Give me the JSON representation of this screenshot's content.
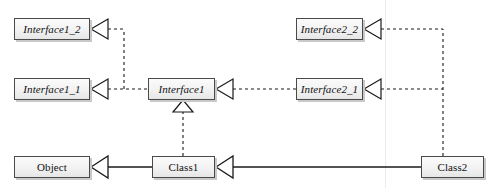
{
  "diagram": {
    "background_color": "#ffffff",
    "node_fill_color": "#f2f2f2",
    "node_border_color": "#4a4a4a",
    "node_shadow_color": "#c9c9c9",
    "line_color": "#1a1a1a",
    "guide_line_color": "#e8e8e8",
    "nodes": [
      {
        "id": "interface1_2",
        "label": "Interface1_2",
        "style": "interface",
        "x": 14,
        "y": 18,
        "w": 76,
        "h": 22
      },
      {
        "id": "interface1_1",
        "label": "Interface1_1",
        "style": "interface",
        "x": 14,
        "y": 78,
        "w": 76,
        "h": 22
      },
      {
        "id": "interface1",
        "label": "Interface1",
        "style": "interface",
        "x": 148,
        "y": 78,
        "w": 67,
        "h": 22
      },
      {
        "id": "interface2_2",
        "label": "Interface2_2",
        "style": "interface",
        "x": 296,
        "y": 18,
        "w": 67,
        "h": 22
      },
      {
        "id": "interface2_1",
        "label": "Interface2_1",
        "style": "interface",
        "x": 296,
        "y": 78,
        "w": 67,
        "h": 22
      },
      {
        "id": "object",
        "label": "Object",
        "style": "class",
        "x": 14,
        "y": 156,
        "w": 76,
        "h": 22
      },
      {
        "id": "class1",
        "label": "Class1",
        "style": "class",
        "x": 152,
        "y": 156,
        "w": 63,
        "h": 22
      },
      {
        "id": "class2",
        "label": "Class2",
        "style": "class",
        "x": 421,
        "y": 156,
        "w": 63,
        "h": 22
      }
    ],
    "edges": [
      {
        "id": "interface1-to-interface1_1",
        "from": "interface1",
        "to": "interface1_1",
        "kind": "realization",
        "line": "dashed",
        "arrow": "hollow-triangle"
      },
      {
        "id": "interface1-to-interface1_2",
        "from": "interface1",
        "to": "interface1_2",
        "kind": "realization",
        "line": "dashed",
        "arrow": "hollow-triangle"
      },
      {
        "id": "class1-to-interface1",
        "from": "class1",
        "to": "interface1",
        "kind": "realization",
        "line": "dashed",
        "arrow": "hollow-triangle"
      },
      {
        "id": "class2-to-interface2_1",
        "from": "class2",
        "to": "interface2_1",
        "kind": "realization",
        "line": "dashed",
        "arrow": "hollow-triangle"
      },
      {
        "id": "class2-to-interface2_2",
        "from": "class2",
        "to": "interface2_2",
        "kind": "realization",
        "line": "dashed",
        "arrow": "hollow-triangle"
      },
      {
        "id": "class1-to-object",
        "from": "class1",
        "to": "object",
        "kind": "generalization",
        "line": "solid",
        "arrow": "hollow-triangle"
      },
      {
        "id": "class2-to-class1",
        "from": "class2",
        "to": "class1",
        "kind": "generalization",
        "line": "solid",
        "arrow": "hollow-triangle"
      }
    ]
  }
}
